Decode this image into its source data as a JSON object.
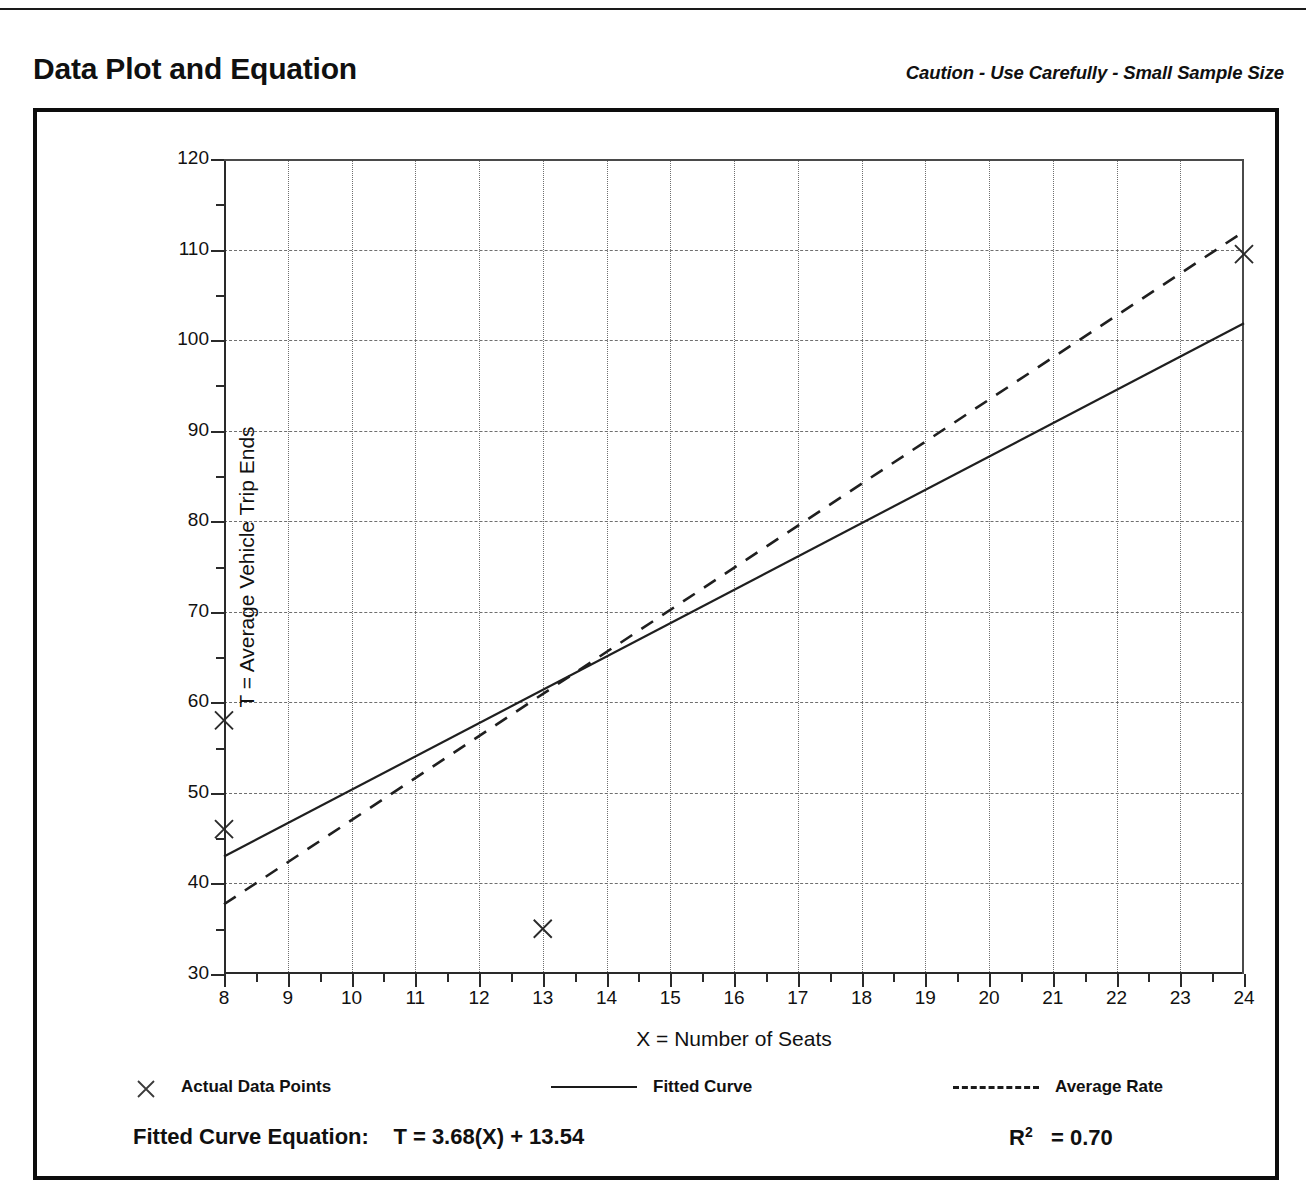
{
  "header": {
    "title": "Data Plot and Equation",
    "caution": "Caution - Use Carefully - Small Sample Size"
  },
  "legend": {
    "items": [
      {
        "label": "Actual Data Points",
        "marker": "x-marker-icon"
      },
      {
        "label": "Fitted Curve",
        "marker": "solid-line-icon"
      },
      {
        "label": "Average Rate",
        "marker": "dashed-line-icon"
      }
    ]
  },
  "footer": {
    "equation_label": "Fitted Curve Equation:",
    "equation": "T = 3.68(X) + 13.54",
    "r_squared_symbol": "R",
    "r_squared_exponent": "2",
    "r_squared_value": "= 0.70"
  },
  "chart_data": {
    "type": "scatter",
    "title": "Data Plot and Equation",
    "xlabel": "X = Number of Seats",
    "ylabel": "T = Average Vehicle Trip Ends",
    "xlim": [
      8,
      24
    ],
    "ylim": [
      30,
      120
    ],
    "xticks": [
      8,
      9,
      10,
      11,
      12,
      13,
      14,
      15,
      16,
      17,
      18,
      19,
      20,
      21,
      22,
      23,
      24
    ],
    "yticks": [
      30,
      40,
      50,
      60,
      70,
      80,
      90,
      100,
      110,
      120
    ],
    "y_minor_step": 5,
    "x_minor_step": 0.5,
    "grid": true,
    "legend_position": "below-plot",
    "points": [
      {
        "x": 8,
        "y": 58
      },
      {
        "x": 8,
        "y": 46
      },
      {
        "x": 13,
        "y": 35
      },
      {
        "x": 24,
        "y": 109.5
      }
    ],
    "series": [
      {
        "name": "Fitted Curve",
        "style": "solid",
        "equation": "T = 3.68(X) + 13.54",
        "slope": 3.68,
        "intercept": 13.54,
        "endpoints": [
          {
            "x": 8,
            "y": 42.98
          },
          {
            "x": 24,
            "y": 101.86
          }
        ]
      },
      {
        "name": "Average Rate",
        "style": "dashed",
        "slope": 4.64,
        "intercept": 0.0,
        "endpoints": [
          {
            "x": 8,
            "y": 37.7
          },
          {
            "x": 24,
            "y": 112.0
          }
        ]
      }
    ],
    "r_squared": 0.7
  }
}
